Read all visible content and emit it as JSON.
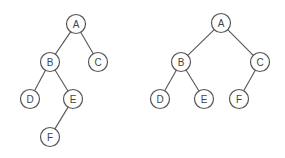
{
  "diagram": {
    "type": "binary-trees",
    "colors": {
      "stroke": "#555555",
      "fill": "#ffffff",
      "text": "#444444",
      "background": "#ffffff"
    },
    "node_radius": 9.5,
    "trees": [
      {
        "id": "left-tree",
        "nodes": [
          {
            "id": "A",
            "label": "A",
            "x": 76,
            "y": 24
          },
          {
            "id": "B",
            "label": "B",
            "x": 50,
            "y": 62
          },
          {
            "id": "C",
            "label": "C",
            "x": 98,
            "y": 62
          },
          {
            "id": "D",
            "label": "D",
            "x": 30,
            "y": 99
          },
          {
            "id": "E",
            "label": "E",
            "x": 73,
            "y": 99
          },
          {
            "id": "F",
            "label": "F",
            "x": 50,
            "y": 137
          }
        ],
        "edges": [
          [
            "A",
            "B"
          ],
          [
            "A",
            "C"
          ],
          [
            "B",
            "D"
          ],
          [
            "B",
            "E"
          ],
          [
            "E",
            "F"
          ]
        ]
      },
      {
        "id": "right-tree",
        "nodes": [
          {
            "id": "A",
            "label": "A",
            "x": 221,
            "y": 23
          },
          {
            "id": "B",
            "label": "B",
            "x": 181,
            "y": 62
          },
          {
            "id": "C",
            "label": "C",
            "x": 260,
            "y": 62
          },
          {
            "id": "D",
            "label": "D",
            "x": 160,
            "y": 99
          },
          {
            "id": "E",
            "label": "E",
            "x": 204,
            "y": 99
          },
          {
            "id": "F",
            "label": "F",
            "x": 239,
            "y": 99
          }
        ],
        "edges": [
          [
            "A",
            "B"
          ],
          [
            "A",
            "C"
          ],
          [
            "B",
            "D"
          ],
          [
            "B",
            "E"
          ],
          [
            "C",
            "F"
          ]
        ]
      }
    ]
  }
}
